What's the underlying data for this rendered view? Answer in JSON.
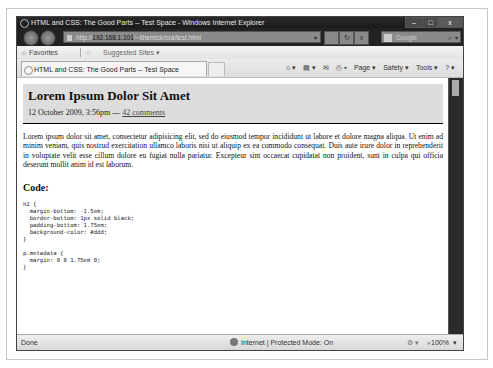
{
  "window": {
    "title": "HTML and CSS: The Good Parts -- Test Space - Windows Internet Explorer",
    "controls": {
      "minimize": "–",
      "maximize": "□",
      "close": "x"
    }
  },
  "address_bar": {
    "scheme": "http://",
    "host": "192.168.1.101",
    "path": "/~lthemick/ora/test.html",
    "dropdown": "▾",
    "refresh": "↻",
    "stop": "x",
    "search_placeholder": "Google",
    "search_icon": "⌕",
    "search_dropdown": "▾"
  },
  "favorites_bar": {
    "favorites_label": "☆ Favorites",
    "add_icon": "☆",
    "suggested_sites": "Suggested Sites ▾"
  },
  "tabs": [
    {
      "label": "HTML and CSS: The Good Parts -- Test Space"
    }
  ],
  "command_bar": {
    "home": "⌂ ▾",
    "feeds": "▤ ▾",
    "mail": "✉",
    "print": "⎙ ▾",
    "page": "Page ▾",
    "safety": "Safety ▾",
    "tools": "Tools ▾",
    "help": "? ▾"
  },
  "page": {
    "heading": "Lorem Ipsum Dolor Sit Amet",
    "meta_date": "12 October 2009, 3:56pm — ",
    "meta_comments": "42 comments",
    "paragraph": "Lorem ipsum dolor sit amet, consectetur adipisicing elit, sed do eiusmod tempor incididunt ut labore et dolore magna aliqua. Ut enim ad minim veniam, quis nostrud exercitation ullamco laboris nisi ut aliquip ex ea commodo consequat. Duis aute irure dolor in reprehenderit in voluptate velit esse cillum dolore eu fugiat nulla pariatur. Excepteur sint occaecat cupidatat non proident, sunt in culpa qui officia deserunt mollit anim id est laborum.",
    "code_heading": "Code:",
    "code": "h2 {\n  margin-bottom: -1.5em;\n  border-bottom: 1px solid black;\n  padding-bottom: 1.75em;\n  background-color: #ddd;\n}\n\np.metadata {\n  margin: 0 0 1.75em 0;\n}"
  },
  "status_bar": {
    "status": "Done",
    "zone": "Internet | Protected Mode: On",
    "security": "⚙ ▾",
    "zoom": "⌕100%",
    "zoom_dropdown": "▾"
  }
}
